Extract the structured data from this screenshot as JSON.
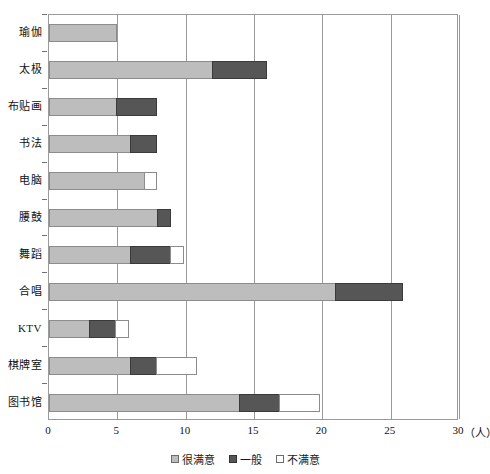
{
  "chart_data": {
    "type": "bar",
    "orientation": "horizontal",
    "stacked": true,
    "title": "",
    "xlabel": "(人)",
    "ylabel": "",
    "xlim": [
      0,
      30
    ],
    "xticks": [
      0,
      5,
      10,
      15,
      20,
      25,
      30
    ],
    "xtick_labels": [
      "0",
      "5",
      "10",
      "15",
      "20",
      "25",
      "30"
    ],
    "x_unit_label": "（人）",
    "grid": true,
    "grid_axis": "x",
    "legend_position": "bottom-center",
    "categories": [
      "瑜伽",
      "太极",
      "布贴画",
      "书法",
      "电脑",
      "腰鼓",
      "舞蹈",
      "合唱",
      "KTV",
      "棋牌室",
      "图书馆"
    ],
    "series": [
      {
        "name": "很满意",
        "color": "#bdbdbd",
        "values": [
          5,
          12,
          5,
          6,
          7,
          8,
          6,
          21,
          3,
          6,
          14
        ]
      },
      {
        "name": "一般",
        "color": "#565656",
        "values": [
          0,
          4,
          3,
          2,
          0,
          1,
          3,
          5,
          2,
          2,
          3
        ]
      },
      {
        "name": "不满意",
        "color": "#ffffff",
        "values": [
          0,
          0,
          0,
          0,
          1,
          0,
          1,
          0,
          1,
          3,
          3
        ]
      }
    ],
    "totals": [
      5,
      16,
      8,
      8,
      8,
      9,
      10,
      26,
      6,
      11,
      20
    ]
  },
  "legend": {
    "items": [
      {
        "label": "很满意",
        "swatch": "swatch-light-gray"
      },
      {
        "label": "一般",
        "swatch": "swatch-dark-gray"
      },
      {
        "label": "不满意",
        "swatch": "swatch-white"
      }
    ]
  }
}
